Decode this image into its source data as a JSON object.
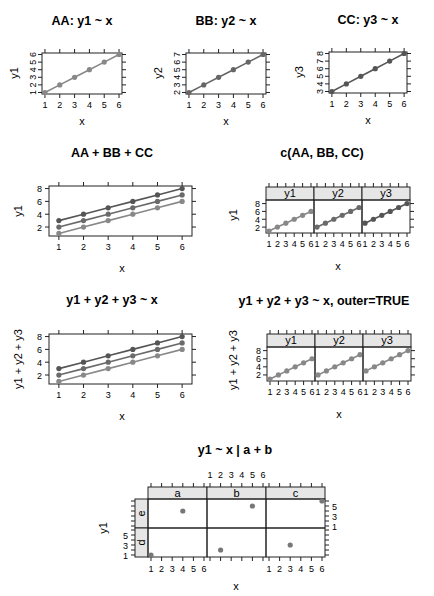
{
  "chart_data": [
    {
      "id": "AA",
      "type": "line",
      "title": "AA: y1 ~ x",
      "xlabel": "x",
      "ylabel": "y1",
      "x": [
        1,
        2,
        3,
        4,
        5,
        6
      ],
      "series": [
        {
          "name": "y1",
          "values": [
            1,
            2,
            3,
            4,
            5,
            6
          ],
          "color": "#888888"
        }
      ],
      "xticks": [
        1,
        2,
        3,
        4,
        5,
        6
      ],
      "yticks": [
        1,
        2,
        3,
        4,
        5,
        6
      ],
      "ylim": [
        1,
        6
      ],
      "grid": false,
      "frame": {
        "x": 42,
        "y": 53,
        "w": 80,
        "h": 41
      },
      "title_pos": {
        "x": 82,
        "y": 25
      },
      "xlabel_pos": {
        "x": 82,
        "y": 125
      },
      "ylabel_pos": {
        "x": 18,
        "y": 73
      }
    },
    {
      "id": "BB",
      "type": "line",
      "title": "BB: y2 ~ x",
      "xlabel": "x",
      "ylabel": "y2",
      "x": [
        1,
        2,
        3,
        4,
        5,
        6
      ],
      "series": [
        {
          "name": "y2",
          "values": [
            2,
            3,
            4,
            5,
            6,
            7
          ],
          "color": "#666666"
        }
      ],
      "xticks": [
        1,
        2,
        3,
        4,
        5,
        6
      ],
      "yticks": [
        2,
        3,
        4,
        5,
        6,
        7
      ],
      "ylim": [
        2,
        7
      ],
      "grid": false,
      "frame": {
        "x": 186,
        "y": 53,
        "w": 80,
        "h": 41
      },
      "title_pos": {
        "x": 226,
        "y": 25
      },
      "xlabel_pos": {
        "x": 226,
        "y": 125
      },
      "ylabel_pos": {
        "x": 162,
        "y": 73
      }
    },
    {
      "id": "CC",
      "type": "line",
      "title": "CC: y3 ~ x",
      "xlabel": "x",
      "ylabel": "y3",
      "x": [
        1,
        2,
        3,
        4,
        5,
        6
      ],
      "series": [
        {
          "name": "y3",
          "values": [
            3,
            4,
            5,
            6,
            7,
            8
          ],
          "color": "#555555"
        }
      ],
      "xticks": [
        1,
        2,
        3,
        4,
        5,
        6
      ],
      "yticks": [
        3,
        4,
        5,
        6,
        7,
        8
      ],
      "ylim": [
        3,
        8
      ],
      "grid": false,
      "frame": {
        "x": 329,
        "y": 52,
        "w": 78,
        "h": 41
      },
      "title_pos": {
        "x": 368,
        "y": 24
      },
      "xlabel_pos": {
        "x": 368,
        "y": 124
      },
      "ylabel_pos": {
        "x": 303,
        "y": 72
      }
    },
    {
      "id": "AA+BB+CC",
      "type": "line",
      "title": "AA + BB + CC",
      "xlabel": "x",
      "ylabel": "y1",
      "x": [
        1,
        2,
        3,
        4,
        5,
        6
      ],
      "series": [
        {
          "name": "y1",
          "values": [
            1,
            2,
            3,
            4,
            5,
            6
          ],
          "color": "#888888"
        },
        {
          "name": "y2",
          "values": [
            2,
            3,
            4,
            5,
            6,
            7
          ],
          "color": "#6a6a6a"
        },
        {
          "name": "y3",
          "values": [
            3,
            4,
            5,
            6,
            7,
            8
          ],
          "color": "#555555"
        }
      ],
      "xticks": [
        1,
        2,
        3,
        4,
        5,
        6
      ],
      "yticks": [
        2,
        4,
        6,
        8
      ],
      "ylim": [
        0.6,
        8.4
      ],
      "xlim": [
        0.6,
        6.4
      ],
      "grid": false,
      "frame": {
        "x": 49,
        "y": 186,
        "w": 143,
        "h": 50
      },
      "title_pos": {
        "x": 112,
        "y": 157
      },
      "xlabel_pos": {
        "x": 122,
        "y": 272
      },
      "ylabel_pos": {
        "x": 22,
        "y": 211
      }
    },
    {
      "id": "c(AA,BB,CC)",
      "type": "line",
      "title": "c(AA, BB, CC)",
      "xlabel": "x",
      "ylabel": "y1",
      "panels": [
        "y1",
        "y2",
        "y3"
      ],
      "x": [
        1,
        2,
        3,
        4,
        5,
        6
      ],
      "series": [
        {
          "name": "y1",
          "values": [
            1,
            2,
            3,
            4,
            5,
            6
          ],
          "color": "#888888"
        },
        {
          "name": "y2",
          "values": [
            2,
            3,
            4,
            5,
            6,
            7
          ],
          "color": "#6a6a6a"
        },
        {
          "name": "y3",
          "values": [
            3,
            4,
            5,
            6,
            7,
            8
          ],
          "color": "#555555"
        }
      ],
      "xticks": [
        1,
        2,
        3,
        4,
        5,
        6
      ],
      "yticks": [
        2,
        4,
        6,
        8
      ],
      "ylim": [
        1,
        8.4
      ],
      "grid": false,
      "frame": {
        "x": 266,
        "y": 200,
        "w": 144,
        "h": 33
      },
      "strip_h": 13,
      "title_pos": {
        "x": 322,
        "y": 157
      },
      "xlabel_pos": {
        "x": 338,
        "y": 270
      },
      "ylabel_pos": {
        "x": 237,
        "y": 215
      }
    },
    {
      "id": "y1+y2+y3~x",
      "type": "line",
      "title": "y1 + y2 + y3 ~ x",
      "xlabel": "x",
      "ylabel": "y1 + y2 + y3",
      "x": [
        1,
        2,
        3,
        4,
        5,
        6
      ],
      "series": [
        {
          "name": "y1",
          "values": [
            1,
            2,
            3,
            4,
            5,
            6
          ],
          "color": "#888888"
        },
        {
          "name": "y2",
          "values": [
            2,
            3,
            4,
            5,
            6,
            7
          ],
          "color": "#6a6a6a"
        },
        {
          "name": "y3",
          "values": [
            3,
            4,
            5,
            6,
            7,
            8
          ],
          "color": "#555555"
        }
      ],
      "xticks": [
        1,
        2,
        3,
        4,
        5,
        6
      ],
      "yticks": [
        2,
        4,
        6,
        8
      ],
      "ylim": [
        0.6,
        8.4
      ],
      "xlim": [
        0.6,
        6.4
      ],
      "grid": false,
      "frame": {
        "x": 49,
        "y": 334,
        "w": 143,
        "h": 50
      },
      "title_pos": {
        "x": 112,
        "y": 304
      },
      "xlabel_pos": {
        "x": 122,
        "y": 420
      },
      "ylabel_pos": {
        "x": 22,
        "y": 359
      }
    },
    {
      "id": "outer=TRUE",
      "type": "line",
      "title": "y1 + y2 + y3 ~ x, outer=TRUE",
      "xlabel": "x",
      "ylabel": "y1 + y2 + y3",
      "panels": [
        "y1",
        "y2",
        "y3"
      ],
      "x": [
        1,
        2,
        3,
        4,
        5,
        6
      ],
      "series": [
        {
          "name": "y1",
          "values": [
            1,
            2,
            3,
            4,
            5,
            6
          ],
          "color": "#888888"
        },
        {
          "name": "y2",
          "values": [
            2,
            3,
            4,
            5,
            6,
            7
          ],
          "color": "#888888"
        },
        {
          "name": "y3",
          "values": [
            3,
            4,
            5,
            6,
            7,
            8
          ],
          "color": "#888888"
        }
      ],
      "xticks": [
        1,
        2,
        3,
        4,
        5,
        6
      ],
      "yticks": [
        2,
        4,
        6,
        8
      ],
      "ylim": [
        1,
        8.4
      ],
      "grid": false,
      "frame": {
        "x": 267,
        "y": 347,
        "w": 144,
        "h": 34
      },
      "strip_h": 13,
      "title_pos": {
        "x": 324,
        "y": 305
      },
      "xlabel_pos": {
        "x": 339,
        "y": 418
      },
      "ylabel_pos": {
        "x": 237,
        "y": 360
      }
    },
    {
      "id": "y1~x|a+b",
      "type": "scatter",
      "title": "y1 ~ x | a + b",
      "xlabel": "x",
      "ylabel": "y1",
      "columns": [
        "a",
        "b",
        "c"
      ],
      "rows": [
        "e",
        "d"
      ],
      "points": [
        {
          "col": "a",
          "row": "d",
          "x": 1,
          "y": 1
        },
        {
          "col": "b",
          "row": "d",
          "x": 2,
          "y": 2
        },
        {
          "col": "c",
          "row": "d",
          "x": 3,
          "y": 3
        },
        {
          "col": "a",
          "row": "e",
          "x": 4,
          "y": 4
        },
        {
          "col": "b",
          "row": "e",
          "x": 5,
          "y": 5
        },
        {
          "col": "c",
          "row": "e",
          "x": 6,
          "y": 6
        }
      ],
      "xticks": [
        1,
        2,
        3,
        4,
        5,
        6
      ],
      "yticks": [
        1,
        3,
        5
      ],
      "xlim": [
        0.6,
        6.4
      ],
      "ylim": [
        0.6,
        6.4
      ],
      "point_color": "#777777",
      "grid": false,
      "frame": {
        "x": 148,
        "y": 499,
        "w": 177,
        "h": 58
      },
      "strip_h": 12,
      "row_strip_w": 13,
      "title_pos": {
        "x": 235,
        "y": 454
      },
      "xlabel_pos": {
        "x": 236,
        "y": 590
      },
      "ylabel_pos": {
        "x": 107,
        "y": 528
      }
    }
  ],
  "colors": {
    "axis": "#222222",
    "strip_bg": "#e6e6e6",
    "point": "#777777"
  }
}
